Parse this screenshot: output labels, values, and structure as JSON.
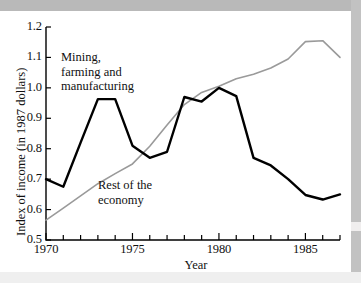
{
  "figure": {
    "axis_title_x": "Year",
    "axis_title_y": "Index of income (in 1987 dollars)",
    "label_series_1": "Mining,\nfarming and\nmanufacturing",
    "label_series_2": "Rest of the\neconomy",
    "color_series_1": "#000000",
    "color_series_2": "#9a9a9a",
    "axis_color": "#000000",
    "background": "#ffffff"
  },
  "chart_data": {
    "type": "line",
    "title": "",
    "xlabel": "Year",
    "ylabel": "Index of income (in 1987 dollars)",
    "xlim": [
      1970,
      1987
    ],
    "ylim": [
      0.5,
      1.2
    ],
    "grid": false,
    "legend": "inline-annotations",
    "x": [
      1970,
      1971,
      1972,
      1973,
      1974,
      1975,
      1976,
      1977,
      1978,
      1979,
      1980,
      1981,
      1982,
      1983,
      1984,
      1985,
      1986,
      1987
    ],
    "xticks_major": [
      1970,
      1975,
      1980,
      1985
    ],
    "xtick_labels": [
      "1970",
      "1975",
      "1980",
      "1985"
    ],
    "xticks_minor_step": 1,
    "yticks": [
      0.5,
      0.6,
      0.7,
      0.8,
      0.9,
      1.0,
      1.1,
      1.2
    ],
    "ytick_labels": [
      "0.5",
      "0.6",
      "0.7",
      "0.8",
      "0.9",
      "1.0",
      "1.1",
      "1.2"
    ],
    "series": [
      {
        "name": "Mining, farming and manufacturing",
        "color": "#000000",
        "linewidth": 2.4,
        "values": [
          0.7,
          0.675,
          0.82,
          0.963,
          0.963,
          0.81,
          0.77,
          0.79,
          0.97,
          0.955,
          1.0,
          0.973,
          0.77,
          0.745,
          0.7,
          0.648,
          0.633,
          0.65
        ]
      },
      {
        "name": "Rest of the economy",
        "color": "#9a9a9a",
        "linewidth": 1.6,
        "values": [
          0.565,
          0.605,
          0.645,
          0.685,
          0.718,
          0.75,
          0.808,
          0.878,
          0.945,
          0.985,
          1.005,
          1.03,
          1.045,
          1.065,
          1.095,
          1.152,
          1.155,
          1.1
        ]
      }
    ]
  }
}
